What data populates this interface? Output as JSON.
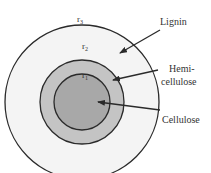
{
  "diagram": {
    "radius_labels": {
      "outer": {
        "base": "r",
        "sub": "3"
      },
      "middle": {
        "base": "r",
        "sub": "2"
      },
      "inner": {
        "base": "r",
        "sub": "1"
      }
    },
    "layers": [
      {
        "name": "Lignin",
        "lines": [
          "Lignin"
        ],
        "fill": "#f4f4f4"
      },
      {
        "name": "Hemicellulose",
        "lines": [
          "Hemi-",
          "cellulose"
        ],
        "fill": "#c4c4c4"
      },
      {
        "name": "Cellulose",
        "lines": [
          "Cellulose"
        ],
        "fill": "#a8a8a8"
      }
    ],
    "stroke_color": "#2a2a2a"
  }
}
